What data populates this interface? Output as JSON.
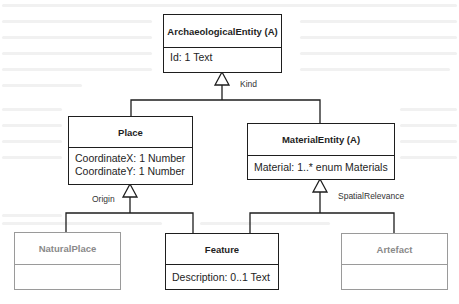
{
  "diagram": {
    "type": "uml-class-hierarchy",
    "classes": {
      "archaeological_entity": {
        "name": "ArchaeologicalEntity (A)",
        "attributes": [
          "Id: 1 Text"
        ]
      },
      "place": {
        "name": "Place",
        "attributes": [
          "CoordinateX: 1 Number",
          "CoordinateY: 1 Number"
        ]
      },
      "material_entity": {
        "name": "MaterialEntity (A)",
        "attributes": [
          "Material: 1..* enum Materials"
        ]
      },
      "natural_place": {
        "name": "NaturalPlace",
        "attributes": [],
        "style": "greyed"
      },
      "feature": {
        "name": "Feature",
        "attributes": [
          "Description: 0..1 Text"
        ]
      },
      "artefact": {
        "name": "Artefact",
        "attributes": [],
        "style": "greyed"
      }
    },
    "generalizations": [
      {
        "label": "Kind",
        "parent": "ArchaeologicalEntity (A)",
        "children": [
          "Place",
          "MaterialEntity (A)"
        ]
      },
      {
        "label": "Origin",
        "parent": "Place",
        "children": [
          "NaturalPlace",
          "Feature"
        ]
      },
      {
        "label": "SpatialRelevance",
        "parent": "MaterialEntity (A)",
        "children": [
          "Feature",
          "Artefact"
        ]
      }
    ],
    "colors": {
      "line": "#1e1e1e",
      "greyed": "#9a9a9a",
      "background": "#ffffff"
    }
  }
}
